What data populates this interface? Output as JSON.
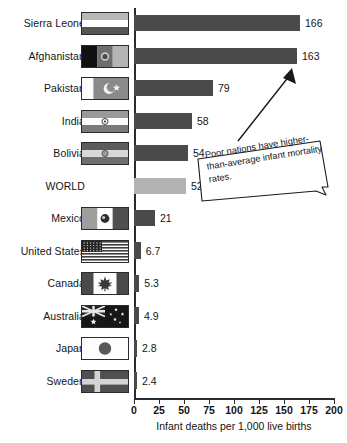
{
  "chart_data": {
    "type": "bar",
    "orientation": "horizontal",
    "title": "",
    "xlabel": "Infant deaths per 1,000 live births",
    "ylabel": "",
    "xlim": [
      0,
      200
    ],
    "xticks": [
      0,
      25,
      50,
      75,
      100,
      125,
      150,
      175,
      200
    ],
    "grid": false,
    "legend": false,
    "categories": [
      "Sierra Leone",
      "Afghanistan",
      "Pakistan",
      "India",
      "Bolivia",
      "WORLD",
      "Mexico",
      "United States",
      "Canada",
      "Australia",
      "Japan",
      "Sweden"
    ],
    "values": [
      166,
      163,
      79,
      58,
      54,
      52,
      21,
      6.7,
      5.3,
      4.9,
      2.8,
      2.4
    ],
    "value_labels": [
      "166",
      "163",
      "79",
      "58",
      "54",
      "52",
      "21",
      "6.7",
      "5.3",
      "4.9",
      "2.8",
      "2.4"
    ],
    "highlight_category": "WORLD",
    "colors": {
      "bar": "#4a4a4a",
      "highlight_bar": "#b3b3b3",
      "axis": "#2b2b2b",
      "text": "#141414",
      "background": "#ffffff"
    },
    "annotations": [
      {
        "text": "Poor nations have higher-than-average infant mortality rates.",
        "points_to": "Afghanistan"
      }
    ]
  },
  "axis": {
    "tick_labels": [
      "0",
      "25",
      "50",
      "75",
      "100",
      "125",
      "150",
      "175",
      "200"
    ],
    "x_title": "Infant deaths per 1,000 live births"
  },
  "rows": [
    {
      "label": "Sierra Leone",
      "value_label": "166",
      "value": 166,
      "has_flag": true,
      "flag_name": "flag-sierra-leone"
    },
    {
      "label": "Afghanistan",
      "value_label": "163",
      "value": 163,
      "has_flag": true,
      "flag_name": "flag-afghanistan"
    },
    {
      "label": "Pakistan",
      "value_label": "79",
      "value": 79,
      "has_flag": true,
      "flag_name": "flag-pakistan"
    },
    {
      "label": "India",
      "value_label": "58",
      "value": 58,
      "has_flag": true,
      "flag_name": "flag-india"
    },
    {
      "label": "Bolivia",
      "value_label": "54",
      "value": 54,
      "has_flag": true,
      "flag_name": "flag-bolivia"
    },
    {
      "label": "WORLD",
      "value_label": "52",
      "value": 52,
      "has_flag": false,
      "flag_name": ""
    },
    {
      "label": "Mexico",
      "value_label": "21",
      "value": 21,
      "has_flag": true,
      "flag_name": "flag-mexico"
    },
    {
      "label": "United States",
      "value_label": "6.7",
      "value": 6.7,
      "has_flag": true,
      "flag_name": "flag-united-states"
    },
    {
      "label": "Canada",
      "value_label": "5.3",
      "value": 5.3,
      "has_flag": true,
      "flag_name": "flag-canada"
    },
    {
      "label": "Australia",
      "value_label": "4.9",
      "value": 4.9,
      "has_flag": true,
      "flag_name": "flag-australia"
    },
    {
      "label": "Japan",
      "value_label": "2.8",
      "value": 2.8,
      "has_flag": true,
      "flag_name": "flag-japan"
    },
    {
      "label": "Sweden",
      "value_label": "2.4",
      "value": 2.4,
      "has_flag": true,
      "flag_name": "flag-sweden"
    }
  ],
  "callout": {
    "text": "Poor nations have higher-than-average infant mortality rates."
  }
}
